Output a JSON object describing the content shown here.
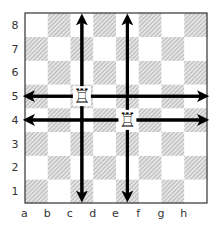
{
  "diagram": {
    "files": [
      "a",
      "b",
      "c",
      "d",
      "e",
      "f",
      "g",
      "h"
    ],
    "ranks": [
      "1",
      "2",
      "3",
      "4",
      "5",
      "6",
      "7",
      "8"
    ],
    "colors": {
      "light_square": "#ffffff",
      "dark_square": "#d0d0d0",
      "hatch": "#8a8a8a",
      "border": "#333333",
      "arrow": "#000000",
      "label": "#333333"
    },
    "pieces": [
      {
        "type": "rook",
        "color": "white",
        "square": "c5",
        "glyph": "♖"
      },
      {
        "type": "rook",
        "color": "white",
        "square": "e4",
        "glyph": "♖"
      }
    ],
    "arrows": [
      {
        "from": "c1",
        "to": "c8",
        "direction": "vertical",
        "piece": "c5"
      },
      {
        "from": "a5",
        "to": "h5",
        "direction": "horizontal",
        "piece": "c5"
      },
      {
        "from": "e1",
        "to": "e8",
        "direction": "vertical",
        "piece": "e4"
      },
      {
        "from": "a4",
        "to": "h4",
        "direction": "horizontal",
        "piece": "e4"
      }
    ]
  }
}
